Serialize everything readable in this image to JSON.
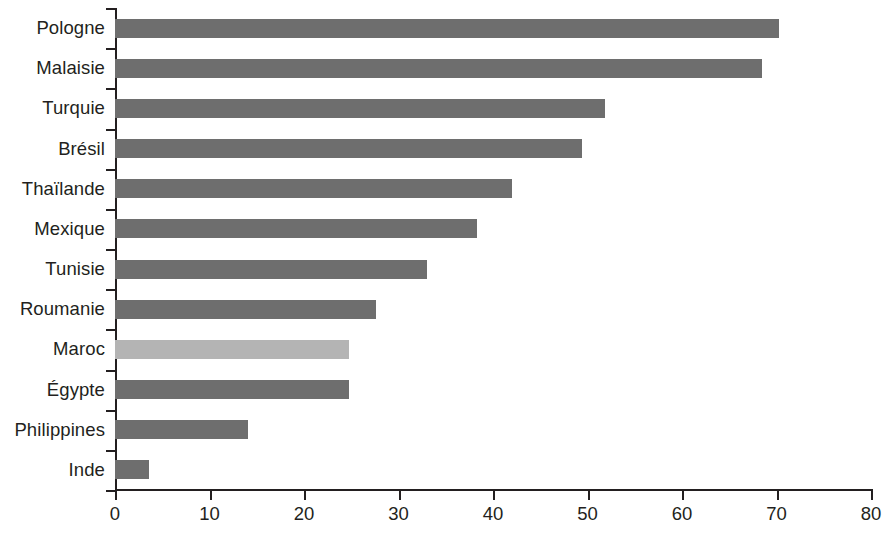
{
  "chart_data": {
    "type": "bar",
    "orientation": "horizontal",
    "title": "",
    "subtitle": "",
    "xlabel": "",
    "ylabel": "",
    "xlim": [
      0,
      80
    ],
    "xticks": [
      "0",
      "10",
      "20",
      "30",
      "40",
      "50",
      "60",
      "70",
      "80"
    ],
    "xtick_values": [
      0,
      10,
      20,
      30,
      40,
      50,
      60,
      70,
      80
    ],
    "grid": false,
    "legend": null,
    "categories": [
      "Pologne",
      "Malaisie",
      "Turquie",
      "Brésil",
      "Thaïlande",
      "Mexique",
      "Tunisie",
      "Roumanie",
      "Maroc",
      "Égypte",
      "Philippines",
      "Inde"
    ],
    "values": [
      70.3,
      68.5,
      51.9,
      49.4,
      42.0,
      38.3,
      33.0,
      27.6,
      24.8,
      24.8,
      14.1,
      3.6
    ],
    "highlighted_category": "Maroc",
    "colors": {
      "bar": "#6e6e6e",
      "bar_highlight": "#b4b4b4",
      "axis": "#231f20",
      "background": "#ffffff"
    }
  }
}
